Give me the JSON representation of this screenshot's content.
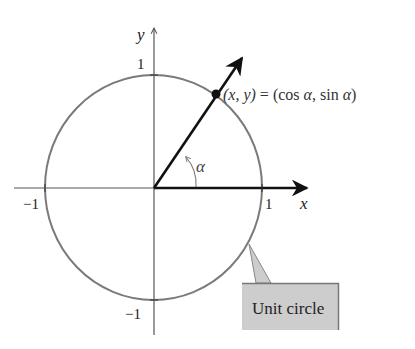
{
  "diagram": {
    "title": "Unit circle",
    "axes": {
      "x_label": "x",
      "y_label": "y",
      "x_tick_pos": "1",
      "x_tick_neg": "−1",
      "y_tick_pos": "1",
      "y_tick_neg": "−1"
    },
    "point_label": {
      "lhs": "(x, y)",
      "eq": " = ",
      "rhs_open": "(cos ",
      "alpha1": "α",
      "sep": ", sin ",
      "alpha2": "α",
      "rhs_close": ")"
    },
    "angle_label": "α",
    "callout_label": "Unit circle",
    "colors": {
      "circle": "#7a7a7a",
      "axes": "#555555",
      "ray": "#111111",
      "callout_fill": "#cdcdcd",
      "callout_border": "#777777",
      "text": "#222222"
    }
  }
}
